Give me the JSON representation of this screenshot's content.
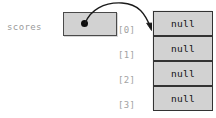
{
  "diagram": {
    "type": "array-reference-diagram",
    "background_color": "#ffffff",
    "variable": {
      "name": "scores",
      "text_color": "#9a9a9a"
    },
    "pointer_box": {
      "label": "",
      "fill_color": "#d2d2d2",
      "border_color": "#4a4a4a",
      "dot_color": "#0d0d0d"
    },
    "arrow": {
      "name": "reference-arrow",
      "color": "#1a1a1a",
      "from": "pointer-box-dot",
      "to": "array-cell-0"
    },
    "array": {
      "fill_color": "#d2d2d2",
      "border_color": "#333333",
      "value_color": "#111111",
      "index_color": "#a2a2a2",
      "cells": [
        {
          "index": "[0]",
          "value": "null"
        },
        {
          "index": "[1]",
          "value": "null"
        },
        {
          "index": "[2]",
          "value": "null"
        },
        {
          "index": "[3]",
          "value": "null"
        }
      ]
    }
  }
}
